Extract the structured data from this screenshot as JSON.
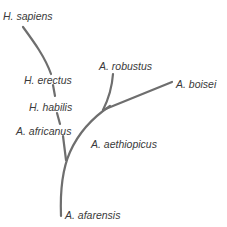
{
  "diagram": {
    "type": "phylogenetic-tree",
    "line_color": "#6e6e6e",
    "text_color": "#3a3a3a",
    "labels": {
      "h_sapiens": "H. sapiens",
      "h_erectus": "H. erectus",
      "h_habilis": "H. habilis",
      "a_africanus": "A. africanus",
      "a_robustus": "A. robustus",
      "a_boisei": "A. boisei",
      "a_aethiopicus": "A. aethiopicus",
      "a_afarensis": "A. afarensis"
    },
    "nodes": [
      {
        "id": "a_afarensis",
        "label": "A. afarensis",
        "role": "root"
      },
      {
        "id": "a_africanus",
        "label": "A. africanus",
        "parent": "a_afarensis"
      },
      {
        "id": "h_habilis",
        "label": "H. habilis",
        "parent": "a_africanus"
      },
      {
        "id": "h_erectus",
        "label": "H. erectus",
        "parent": "h_habilis"
      },
      {
        "id": "h_sapiens",
        "label": "H. sapiens",
        "parent": "h_erectus"
      },
      {
        "id": "a_aethiopicus",
        "label": "A. aethiopicus",
        "parent": "a_afarensis"
      },
      {
        "id": "a_robustus",
        "label": "A. robustus",
        "parent": "a_aethiopicus"
      },
      {
        "id": "a_boisei",
        "label": "A. boisei",
        "parent": "a_aethiopicus"
      }
    ]
  }
}
